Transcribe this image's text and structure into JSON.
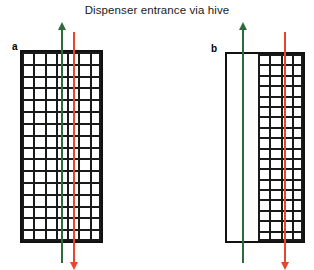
{
  "figure": {
    "title": "Dispenser entrance via hive",
    "width": 314,
    "height": 270,
    "background": "#ffffff"
  },
  "colors": {
    "frame": "#111111",
    "grid_line": "#1a1a1a",
    "green_arrow": "#2d6b3a",
    "red_arrow": "#e8452c",
    "text": "#1a1a1a"
  },
  "panels": [
    {
      "id": "a",
      "label": "a",
      "label_x": 12,
      "label_y": 42,
      "box": {
        "x": 20,
        "y": 50,
        "width": 83,
        "height": 193
      },
      "grid": {
        "x": 22,
        "y": 52,
        "width": 79,
        "height": 189,
        "columns": 7,
        "rows": 16
      },
      "grid_fill": "full",
      "arrows": [
        {
          "name": "green-up-arrow",
          "color": "#2d6b3a",
          "direction": "up",
          "x": 62,
          "top": 29,
          "bottom": 263
        },
        {
          "name": "red-down-arrow",
          "color": "#e8452c",
          "direction": "down",
          "x": 74,
          "top": 32,
          "bottom": 263
        }
      ]
    },
    {
      "id": "b",
      "label": "b",
      "label_x": 211,
      "label_y": 44,
      "box": {
        "x": 225,
        "y": 52,
        "width": 80,
        "height": 191
      },
      "grid": {
        "x": 258,
        "y": 54,
        "width": 45,
        "height": 187,
        "columns": 4,
        "rows": 18
      },
      "grid_fill": "right-portion",
      "arrows": [
        {
          "name": "green-up-arrow",
          "color": "#2d6b3a",
          "direction": "up",
          "x": 243,
          "top": 29,
          "bottom": 263
        },
        {
          "name": "red-down-arrow",
          "color": "#e8452c",
          "direction": "down",
          "x": 285,
          "top": 32,
          "bottom": 263
        }
      ]
    }
  ]
}
